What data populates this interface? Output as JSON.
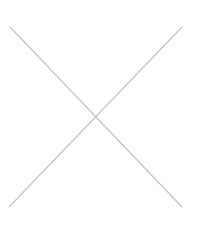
{
  "image": {
    "width": 209,
    "height": 245,
    "background": "#ffffff",
    "placeholder": {
      "kind": "cross",
      "stroke": "#c4c4c4",
      "stroke_width": 1.2,
      "lines": [
        {
          "x1": 10,
          "y1": 27,
          "x2": 182,
          "y2": 207
        },
        {
          "x1": 182,
          "y1": 27,
          "x2": 9,
          "y2": 207
        }
      ]
    }
  }
}
